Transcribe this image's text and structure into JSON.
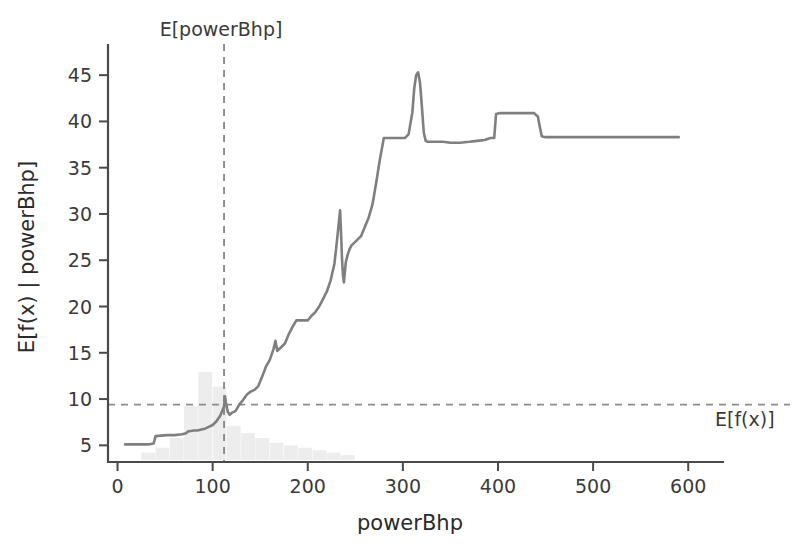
{
  "chart_data": {
    "type": "line",
    "title": "",
    "xlabel": "powerBhp",
    "ylabel": "E[f(x) | powerBhp]",
    "xlim": [
      -10,
      625
    ],
    "ylim": [
      3.2,
      47.5
    ],
    "grid": false,
    "legend": "none",
    "xticks": [
      0,
      100,
      200,
      300,
      400,
      500,
      600
    ],
    "xticklabels": [
      "0",
      "100",
      "200",
      "300",
      "400",
      "500",
      "600"
    ],
    "yticks": [
      5,
      10,
      15,
      20,
      25,
      30,
      35,
      40,
      45
    ],
    "yticklabels": [
      "5",
      "10",
      "15",
      "20",
      "25",
      "30",
      "35",
      "40",
      "45"
    ],
    "series": [
      {
        "name": "E[f(x) | powerBhp]",
        "color": "#7f7f7f",
        "style": "solid",
        "x": [
          8,
          20,
          32,
          38,
          40,
          52,
          60,
          68,
          72,
          74,
          80,
          84,
          88,
          92,
          96,
          100,
          104,
          108,
          112,
          113,
          114,
          116,
          118,
          120,
          124,
          128,
          132,
          136,
          140,
          144,
          148,
          152,
          156,
          160,
          164,
          166,
          168,
          172,
          176,
          180,
          184,
          188,
          192,
          196,
          200,
          204,
          208,
          212,
          216,
          220,
          224,
          228,
          230,
          232,
          234,
          235,
          236,
          237,
          238,
          240,
          242,
          244,
          246,
          248,
          252,
          256,
          260,
          264,
          268,
          272,
          276,
          280,
          284,
          290,
          296,
          302,
          306,
          310,
          312,
          314,
          316,
          318,
          320,
          322,
          324,
          326,
          330,
          336,
          342,
          350,
          360,
          370,
          378,
          386,
          392,
          396,
          398,
          402,
          410,
          420,
          430,
          438,
          442,
          444,
          446,
          450,
          460,
          480,
          500,
          520,
          540,
          560,
          580,
          590
        ],
        "y": [
          5.1,
          5.1,
          5.1,
          5.2,
          6.0,
          6.1,
          6.1,
          6.2,
          6.3,
          6.5,
          6.6,
          6.6,
          6.7,
          6.8,
          7.0,
          7.2,
          7.6,
          8.2,
          9.2,
          10.3,
          9.6,
          8.6,
          8.3,
          8.5,
          8.7,
          9.4,
          9.9,
          10.5,
          10.8,
          11.0,
          11.4,
          12.4,
          13.5,
          14.2,
          15.4,
          16.3,
          15.2,
          15.6,
          16.0,
          17.0,
          17.8,
          18.5,
          18.5,
          18.5,
          18.5,
          19.0,
          19.4,
          20.0,
          20.8,
          21.6,
          22.8,
          24.6,
          26.4,
          28.4,
          30.4,
          28.0,
          25.2,
          23.4,
          22.6,
          24.8,
          25.6,
          26.2,
          26.6,
          26.8,
          27.2,
          27.6,
          28.6,
          29.6,
          31.0,
          33.4,
          36.0,
          38.2,
          38.2,
          38.2,
          38.2,
          38.2,
          38.6,
          41.0,
          43.6,
          45.0,
          45.3,
          44.2,
          41.6,
          38.8,
          37.9,
          37.8,
          37.8,
          37.8,
          37.8,
          37.7,
          37.7,
          37.8,
          37.9,
          38.0,
          38.2,
          38.2,
          40.8,
          40.9,
          40.9,
          40.9,
          40.9,
          40.9,
          40.5,
          39.4,
          38.4,
          38.3,
          38.3,
          38.3,
          38.3,
          38.3,
          38.3,
          38.3,
          38.3,
          38.3
        ]
      }
    ],
    "distribution_histogram": {
      "description": "faint light-gray marginal distribution of powerBhp along the bottom",
      "color": "#ededed",
      "bin_edges": [
        25,
        40,
        55,
        70,
        85,
        100,
        115,
        130,
        145,
        160,
        175,
        190,
        205,
        220,
        235,
        250
      ],
      "bin_counts": [
        3,
        5,
        9,
        22,
        36,
        30,
        14,
        11,
        9,
        7,
        6,
        5,
        4,
        3,
        2
      ]
    },
    "annotations": [
      {
        "name": "expected-powerBhp-line",
        "label": "E[powerBhp]",
        "orientation": "vertical",
        "value": 112,
        "style": "dashed",
        "color": "#8c8c8c",
        "label_position": "top"
      },
      {
        "name": "expected-fx-line",
        "label": "E[f(x)]",
        "orientation": "horizontal",
        "value": 9.4,
        "style": "dashed",
        "color": "#8c8c8c",
        "label_position": "right"
      }
    ]
  },
  "colors": {
    "background": "#ffffff",
    "curve": "#7f7f7f",
    "axis": "#4a4a4a",
    "dashed_reference": "#8c8c8c",
    "histogram": "#ededed",
    "text": "#3a3a3a"
  }
}
